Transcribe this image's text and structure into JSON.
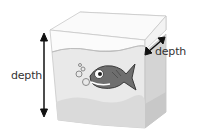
{
  "diagram": {
    "labels": {
      "height_label": "depth",
      "width_label": "depth"
    },
    "icons": [
      "fish-icon",
      "bubbles-icon",
      "double-arrow-vertical-icon",
      "double-arrow-diagonal-icon",
      "aquarium-tank-icon"
    ],
    "colors": {
      "tank_edge": "#c8c8c8",
      "water": "#e6e6e6",
      "water_side": "#d2d2d2",
      "sand": "#d9d9d9",
      "fish_body": "#6e6e6e",
      "arrow": "#111111",
      "text": "#333333"
    }
  }
}
